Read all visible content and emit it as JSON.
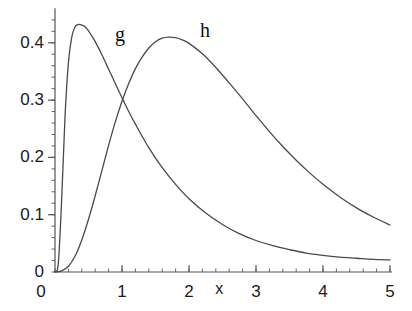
{
  "chart_data": {
    "type": "line",
    "title": "",
    "subtitle": "",
    "xlabel": "x",
    "ylabel": "",
    "xlim": [
      0,
      5
    ],
    "ylim": [
      0,
      0.45
    ],
    "grid": false,
    "legend_position": "inline-curve-labels",
    "background_color": "#ffffff",
    "axis_color": "#555555",
    "curve_color": "#4a4a4a",
    "x_ticks": [
      {
        "value": 0,
        "label": "0"
      },
      {
        "value": 1,
        "label": "1"
      },
      {
        "value": 2,
        "label": "2"
      },
      {
        "value": 3,
        "label": "3"
      },
      {
        "value": 4,
        "label": "4"
      },
      {
        "value": 5,
        "label": "5"
      }
    ],
    "x_minor_tick_step": 0.2,
    "y_ticks": [
      {
        "value": 0,
        "label": "0"
      },
      {
        "value": 0.1,
        "label": "0.1"
      },
      {
        "value": 0.2,
        "label": "0.2"
      },
      {
        "value": 0.3,
        "label": "0.3"
      },
      {
        "value": 0.4,
        "label": "0.4"
      }
    ],
    "y_minor_tick_step": 0.02,
    "annotations": [
      {
        "text": "g",
        "x": 0.97,
        "y": 0.415
      },
      {
        "text": "h",
        "x": 2.24,
        "y": 0.423
      }
    ],
    "series": [
      {
        "name": "g",
        "label": "g",
        "color": "#4a4a4a",
        "peak": {
          "x": 0.45,
          "y": 0.432
        },
        "x": [
          0.0,
          0.05,
          0.1,
          0.15,
          0.2,
          0.25,
          0.3,
          0.35,
          0.4,
          0.45,
          0.5,
          0.55,
          0.6,
          0.7,
          0.8,
          0.9,
          1.0,
          1.1,
          1.2,
          1.4,
          1.6,
          1.8,
          2.0,
          2.25,
          2.5,
          2.75,
          3.0,
          3.25,
          3.5,
          3.75,
          4.0,
          4.25,
          4.5,
          4.75,
          5.0
        ],
        "y": [
          0.0,
          0.016,
          0.128,
          0.272,
          0.365,
          0.41,
          0.428,
          0.432,
          0.431,
          0.428,
          0.421,
          0.412,
          0.402,
          0.379,
          0.354,
          0.329,
          0.304,
          0.28,
          0.258,
          0.217,
          0.182,
          0.153,
          0.128,
          0.103,
          0.083,
          0.067,
          0.055,
          0.046,
          0.039,
          0.033,
          0.029,
          0.026,
          0.024,
          0.022,
          0.021
        ]
      },
      {
        "name": "h",
        "label": "h",
        "color": "#4a4a4a",
        "peak": {
          "x": 1.7,
          "y": 0.41
        },
        "x": [
          0.0,
          0.1,
          0.2,
          0.3,
          0.4,
          0.5,
          0.6,
          0.7,
          0.8,
          0.9,
          1.0,
          1.1,
          1.2,
          1.3,
          1.4,
          1.5,
          1.6,
          1.7,
          1.8,
          1.9,
          2.0,
          2.2,
          2.4,
          2.6,
          2.8,
          3.0,
          3.2,
          3.4,
          3.6,
          3.8,
          4.0,
          4.25,
          4.5,
          4.75,
          5.0
        ],
        "y": [
          0.0,
          0.002,
          0.01,
          0.028,
          0.056,
          0.092,
          0.133,
          0.177,
          0.221,
          0.262,
          0.298,
          0.329,
          0.355,
          0.375,
          0.391,
          0.402,
          0.408,
          0.41,
          0.409,
          0.405,
          0.399,
          0.381,
          0.357,
          0.33,
          0.302,
          0.273,
          0.245,
          0.219,
          0.195,
          0.173,
          0.153,
          0.131,
          0.112,
          0.096,
          0.082
        ]
      }
    ]
  },
  "geometry": {
    "origin_px": {
      "x": 55,
      "y": 272
    },
    "x_unit_px": 67,
    "y_unit_px": 573
  }
}
